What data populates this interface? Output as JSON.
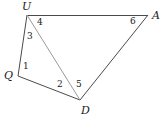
{
  "figure": {
    "type": "geometry-diagram",
    "canvas": {
      "width": 168,
      "height": 119,
      "background": "#ffffff"
    },
    "colors": {
      "outline_stroke": "#4a4a4a",
      "diagonal_stroke": "#9a9a9a",
      "label_text": "#1a1a1a"
    },
    "vertices": [
      {
        "id": "U",
        "label": "U",
        "x": 27,
        "y": 15,
        "label_x": 22,
        "label_y": 1
      },
      {
        "id": "A",
        "label": "A",
        "x": 148,
        "y": 15,
        "label_x": 152,
        "label_y": 10
      },
      {
        "id": "D",
        "label": "D",
        "x": 80,
        "y": 100,
        "label_x": 81,
        "label_y": 105
      },
      {
        "id": "Q",
        "label": "Q",
        "x": 18,
        "y": 76,
        "label_x": 4,
        "label_y": 70
      }
    ],
    "segments": [
      {
        "id": "UA",
        "from": "U",
        "to": "A",
        "style": "solid",
        "shade": "dark"
      },
      {
        "id": "AD",
        "from": "A",
        "to": "D",
        "style": "solid",
        "shade": "dark"
      },
      {
        "id": "DQ",
        "from": "D",
        "to": "Q",
        "style": "solid",
        "shade": "dark"
      },
      {
        "id": "QU",
        "from": "Q",
        "to": "U",
        "style": "solid",
        "shade": "dark"
      },
      {
        "id": "UD",
        "from": "U",
        "to": "D",
        "style": "solid",
        "shade": "light"
      }
    ],
    "angle_labels": [
      {
        "id": "angle-1",
        "text": "1",
        "at_vertex": "Q",
        "x": 23,
        "y": 62
      },
      {
        "id": "angle-2",
        "text": "2",
        "at_vertex": "D",
        "x": 57,
        "y": 80
      },
      {
        "id": "angle-3",
        "text": "3",
        "at_vertex": "U",
        "x": 27,
        "y": 32
      },
      {
        "id": "angle-4",
        "text": "4",
        "at_vertex": "U",
        "x": 37,
        "y": 18
      },
      {
        "id": "angle-5",
        "text": "5",
        "at_vertex": "D",
        "x": 76,
        "y": 80
      },
      {
        "id": "angle-6",
        "text": "6",
        "at_vertex": "A",
        "x": 130,
        "y": 17
      }
    ]
  }
}
